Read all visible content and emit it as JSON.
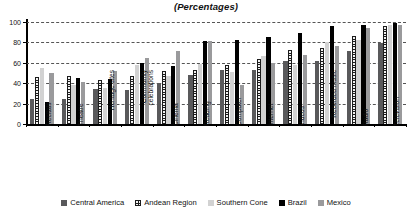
{
  "chart_data": {
    "type": "bar",
    "title": "(Percentages)",
    "xlabel": "",
    "ylabel": "",
    "ylim": [
      0,
      100
    ],
    "yticks": [
      0,
      20,
      40,
      60,
      80,
      100
    ],
    "grid": true,
    "legend_position": "bottom",
    "categories": [
      "Recitals",
      "Theatre",
      "Heritage sites",
      "Community celebrations",
      "Cinema",
      "Reading",
      "Computer",
      "Internet",
      "Videos",
      "Recorded music",
      "Radio",
      "Television"
    ],
    "series": [
      {
        "name": "Central America",
        "color": "#59595b",
        "pattern": "solid-dark-gray",
        "values": [
          25,
          25,
          34,
          33,
          40,
          48,
          53,
          53,
          62,
          62,
          72,
          79
        ]
      },
      {
        "name": "Andean Region",
        "color": "#1c1c1c",
        "pattern": "crosshatch",
        "values": [
          46,
          47,
          43,
          47,
          52,
          53,
          58,
          64,
          73,
          75,
          86,
          96
        ]
      },
      {
        "name": "Southern Cone",
        "color": "#d2d2d2",
        "pattern": "solid-light-gray",
        "values": [
          55,
          38,
          35,
          58,
          47,
          59,
          51,
          67,
          58,
          80,
          82,
          97
        ]
      },
      {
        "name": "Brazil",
        "color": "#000000",
        "pattern": "solid-black",
        "values": [
          22,
          45,
          44,
          60,
          57,
          81,
          82,
          85,
          89,
          96,
          97,
          99
        ]
      },
      {
        "name": "Mexico",
        "color": "#9a9a9c",
        "pattern": "solid-medium-gray",
        "values": [
          50,
          41,
          52,
          65,
          72,
          81,
          38,
          60,
          68,
          76,
          94,
          97
        ]
      }
    ]
  },
  "legend": {
    "items": [
      {
        "label": "Central America"
      },
      {
        "label": "Andean Region"
      },
      {
        "label": "Southern Cone"
      },
      {
        "label": "Brazil"
      },
      {
        "label": "Mexico"
      }
    ]
  }
}
